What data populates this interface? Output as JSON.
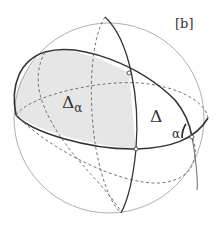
{
  "figure": {
    "panel_label": "[b]",
    "labels": {
      "region_shaded": "Δ",
      "region_shaded_subscript": "α",
      "triangle": "Δ",
      "angle": "α"
    },
    "colors": {
      "sphere_outline": "#9a9a9a",
      "great_circle_solid": "#333333",
      "great_circle_dashed": "#666666",
      "shaded_fill": "#e6e6e6",
      "background": "#ffffff"
    }
  }
}
